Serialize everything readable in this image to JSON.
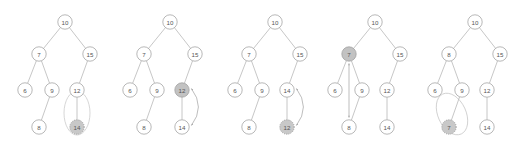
{
  "figure": {
    "background_color": "#ffffff",
    "width": 518,
    "height": 153,
    "panel_count": 5
  },
  "style": {
    "node_fill": "#ffffff",
    "node_stroke": "#9a9a9a",
    "node_radius": 7.2,
    "label_color": "#555555",
    "edge_color": "#a8a8a8",
    "highlight_solid_fill": "#c2c2c2",
    "highlight_dotted_fill": "#c8c8c8",
    "annotation_ellipse_color": "#c4c4c4",
    "arrow_color": "#a0a0a0"
  },
  "panels": [
    {
      "id": "panel-1",
      "caption": "",
      "origin_x": 0,
      "nodes": [
        {
          "key": "n10",
          "label": "10",
          "x": 65,
          "y": 22,
          "highlight": "none"
        },
        {
          "key": "n7",
          "label": "7",
          "x": 39,
          "y": 54,
          "highlight": "none"
        },
        {
          "key": "n15",
          "label": "15",
          "x": 90,
          "y": 54,
          "highlight": "none"
        },
        {
          "key": "n6",
          "label": "6",
          "x": 25,
          "y": 90,
          "highlight": "none"
        },
        {
          "key": "n9",
          "label": "9",
          "x": 52,
          "y": 90,
          "highlight": "none"
        },
        {
          "key": "n12",
          "label": "12",
          "x": 77,
          "y": 90,
          "highlight": "none"
        },
        {
          "key": "n8",
          "label": "8",
          "x": 39,
          "y": 127,
          "highlight": "none"
        },
        {
          "key": "n14",
          "label": "14",
          "x": 77,
          "y": 127,
          "highlight": "dotted"
        }
      ],
      "edges": [
        [
          "n10",
          "n7"
        ],
        [
          "n10",
          "n15"
        ],
        [
          "n7",
          "n6"
        ],
        [
          "n7",
          "n9"
        ],
        [
          "n15",
          "n12"
        ],
        [
          "n9",
          "n8"
        ],
        [
          "n12",
          "n14"
        ]
      ],
      "annotation_ellipse": {
        "cx": 77,
        "cy": 113,
        "rx": 13,
        "ry": 22,
        "rotate": 0
      },
      "swap_arrow": null
    },
    {
      "id": "panel-2",
      "caption": "",
      "origin_x": 105,
      "nodes": [
        {
          "key": "n10",
          "label": "10",
          "x": 65,
          "y": 22,
          "highlight": "none"
        },
        {
          "key": "n7",
          "label": "7",
          "x": 39,
          "y": 54,
          "highlight": "none"
        },
        {
          "key": "n15",
          "label": "15",
          "x": 90,
          "y": 54,
          "highlight": "none"
        },
        {
          "key": "n6",
          "label": "6",
          "x": 25,
          "y": 90,
          "highlight": "none"
        },
        {
          "key": "n9",
          "label": "9",
          "x": 52,
          "y": 90,
          "highlight": "none"
        },
        {
          "key": "n12",
          "label": "12",
          "x": 77,
          "y": 90,
          "highlight": "solid"
        },
        {
          "key": "n8",
          "label": "8",
          "x": 39,
          "y": 127,
          "highlight": "none"
        },
        {
          "key": "n14",
          "label": "14",
          "x": 77,
          "y": 127,
          "highlight": "none"
        }
      ],
      "edges": [
        [
          "n10",
          "n7"
        ],
        [
          "n10",
          "n15"
        ],
        [
          "n7",
          "n6"
        ],
        [
          "n7",
          "n9"
        ],
        [
          "n15",
          "n12"
        ],
        [
          "n9",
          "n8"
        ],
        [
          "n12",
          "n14"
        ]
      ],
      "annotation_ellipse": null,
      "swap_arrow": {
        "type": "curved",
        "from": "n14",
        "to": "n12",
        "bulge": 14
      }
    },
    {
      "id": "panel-3",
      "caption": "",
      "origin_x": 210,
      "nodes": [
        {
          "key": "n10",
          "label": "10",
          "x": 65,
          "y": 22,
          "highlight": "none"
        },
        {
          "key": "n7",
          "label": "7",
          "x": 39,
          "y": 54,
          "highlight": "none"
        },
        {
          "key": "n15",
          "label": "15",
          "x": 90,
          "y": 54,
          "highlight": "none"
        },
        {
          "key": "n6",
          "label": "6",
          "x": 25,
          "y": 90,
          "highlight": "none"
        },
        {
          "key": "n9",
          "label": "9",
          "x": 52,
          "y": 90,
          "highlight": "none"
        },
        {
          "key": "n14",
          "label": "14",
          "x": 77,
          "y": 90,
          "highlight": "none"
        },
        {
          "key": "n8",
          "label": "8",
          "x": 39,
          "y": 127,
          "highlight": "none"
        },
        {
          "key": "n12",
          "label": "12",
          "x": 77,
          "y": 127,
          "highlight": "dotted"
        }
      ],
      "edges": [
        [
          "n10",
          "n7"
        ],
        [
          "n10",
          "n15"
        ],
        [
          "n7",
          "n6"
        ],
        [
          "n7",
          "n9"
        ],
        [
          "n15",
          "n14"
        ],
        [
          "n9",
          "n8"
        ],
        [
          "n14",
          "n12"
        ]
      ],
      "annotation_ellipse": null,
      "swap_arrow": {
        "type": "curved",
        "from": "n14",
        "to": "n12",
        "bulge": 14
      }
    },
    {
      "id": "panel-4",
      "caption": "",
      "origin_x": 310,
      "nodes": [
        {
          "key": "n10",
          "label": "10",
          "x": 65,
          "y": 22,
          "highlight": "none"
        },
        {
          "key": "n7",
          "label": "7",
          "x": 39,
          "y": 54,
          "highlight": "solid"
        },
        {
          "key": "n15",
          "label": "15",
          "x": 90,
          "y": 54,
          "highlight": "none"
        },
        {
          "key": "n6",
          "label": "6",
          "x": 25,
          "y": 90,
          "highlight": "none"
        },
        {
          "key": "n9",
          "label": "9",
          "x": 52,
          "y": 90,
          "highlight": "none"
        },
        {
          "key": "n12",
          "label": "12",
          "x": 77,
          "y": 90,
          "highlight": "none"
        },
        {
          "key": "n8",
          "label": "8",
          "x": 39,
          "y": 127,
          "highlight": "none"
        },
        {
          "key": "n14",
          "label": "14",
          "x": 77,
          "y": 127,
          "highlight": "none"
        }
      ],
      "edges": [
        [
          "n10",
          "n7"
        ],
        [
          "n10",
          "n15"
        ],
        [
          "n7",
          "n6"
        ],
        [
          "n7",
          "n9"
        ],
        [
          "n15",
          "n12"
        ],
        [
          "n9",
          "n8"
        ],
        [
          "n12",
          "n14"
        ]
      ],
      "annotation_ellipse": null,
      "swap_arrow": {
        "type": "straight",
        "from": "n7",
        "to": "n8",
        "bulge": 0
      }
    },
    {
      "id": "panel-5",
      "caption": "",
      "origin_x": 410,
      "nodes": [
        {
          "key": "n10",
          "label": "10",
          "x": 65,
          "y": 22,
          "highlight": "none"
        },
        {
          "key": "n8",
          "label": "8",
          "x": 39,
          "y": 54,
          "highlight": "none"
        },
        {
          "key": "n15",
          "label": "15",
          "x": 90,
          "y": 54,
          "highlight": "none"
        },
        {
          "key": "n6",
          "label": "6",
          "x": 25,
          "y": 90,
          "highlight": "none"
        },
        {
          "key": "n9",
          "label": "9",
          "x": 52,
          "y": 90,
          "highlight": "none"
        },
        {
          "key": "n12",
          "label": "12",
          "x": 77,
          "y": 90,
          "highlight": "none"
        },
        {
          "key": "n7",
          "label": "7",
          "x": 39,
          "y": 127,
          "highlight": "dotted"
        },
        {
          "key": "n14",
          "label": "14",
          "x": 77,
          "y": 127,
          "highlight": "none"
        }
      ],
      "edges": [
        [
          "n10",
          "n8"
        ],
        [
          "n10",
          "n15"
        ],
        [
          "n8",
          "n6"
        ],
        [
          "n8",
          "n9"
        ],
        [
          "n15",
          "n12"
        ],
        [
          "n9",
          "n7"
        ],
        [
          "n12",
          "n14"
        ]
      ],
      "annotation_ellipse": {
        "cx": 42,
        "cy": 114,
        "rx": 14,
        "ry": 22,
        "rotate": -25
      },
      "swap_arrow": null
    }
  ]
}
